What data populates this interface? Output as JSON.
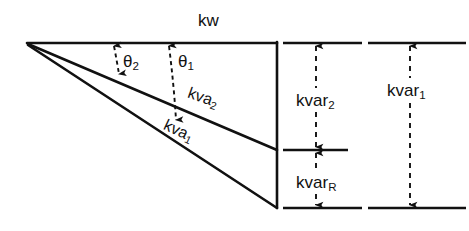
{
  "figure": {
    "type": "power-triangle-vector-diagram",
    "background_color": "#ffffff",
    "line_color": "#111111"
  },
  "labels": {
    "kw": "kw",
    "theta2_base": "θ",
    "theta2_sub": "2",
    "theta1_base": "θ",
    "theta1_sub": "1",
    "kva2_base": "kva",
    "kva2_sub": "2",
    "kva1_base": "kva",
    "kva1_sub": "1",
    "kvar2_base": "kvar",
    "kvar2_sub": "2",
    "kvarR_base": "kvar",
    "kvarR_sub": "R",
    "kvar1_base": "kvar",
    "kvar1_sub": "1"
  },
  "geometry": {
    "apex": [
      27,
      43
    ],
    "kw_line": [
      [
        27,
        43
      ],
      [
        277,
        43
      ]
    ],
    "vertical_line": [
      [
        277,
        43
      ],
      [
        277,
        208
      ]
    ],
    "kva2_line": [
      [
        27,
        43
      ],
      [
        277,
        150
      ]
    ],
    "kva1_line": [
      [
        27,
        43
      ],
      [
        277,
        208
      ]
    ],
    "theta2_arc_x": 115,
    "theta2_arc_span": [
      43,
      78
    ],
    "theta1_arc_x": 170,
    "theta1_arc_span": [
      43,
      124
    ],
    "kvar2_dim": {
      "x": 316,
      "from_y": 43,
      "to_y": 150
    },
    "kvarR_dim": {
      "x": 316,
      "from_y": 150,
      "to_y": 208
    },
    "kvar1_dim": {
      "x": 410,
      "from_y": 43,
      "to_y": 208
    },
    "ref_line_top_inner": [
      [
        283,
        43
      ],
      [
        362,
        43
      ]
    ],
    "ref_line_top_outer": [
      [
        368,
        43
      ],
      [
        466,
        43
      ]
    ],
    "ref_line_mid_inner": [
      [
        283,
        150
      ],
      [
        348,
        150
      ]
    ],
    "ref_line_bot_inner": [
      [
        283,
        208
      ],
      [
        362,
        208
      ]
    ],
    "ref_line_bot_outer": [
      [
        368,
        208
      ],
      [
        466,
        208
      ]
    ]
  }
}
